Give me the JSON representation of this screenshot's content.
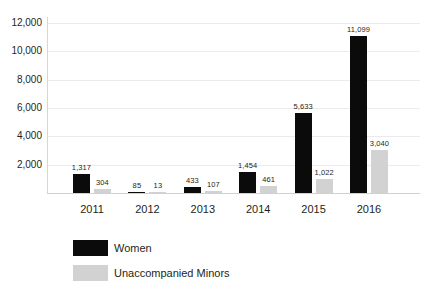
{
  "chart_data": {
    "type": "bar",
    "title": "",
    "xlabel": "",
    "ylabel": "",
    "categories": [
      "2011",
      "2012",
      "2013",
      "2014",
      "2015",
      "2016"
    ],
    "series": [
      {
        "name": "Women",
        "color": "#0b0b0b",
        "values": [
          1317,
          85,
          433,
          1454,
          5633,
          11099
        ],
        "labels": [
          "1,317",
          "85",
          "433",
          "1,454",
          "5,633",
          "11,099"
        ]
      },
      {
        "name": "Unaccompanied Minors",
        "color": "#d2d2d2",
        "values": [
          304,
          13,
          107,
          461,
          1022,
          3040
        ],
        "labels": [
          "304",
          "13",
          "107",
          "461",
          "1,022",
          "3,040"
        ]
      }
    ],
    "ylim": [
      0,
      12000
    ],
    "yticks": [
      2000,
      4000,
      6000,
      8000,
      10000,
      12000
    ],
    "ytick_labels": [
      "2,000",
      "4,000",
      "6,000",
      "8,000",
      "10,000",
      "12,000"
    ],
    "grid": true,
    "legend_position": "bottom-left"
  }
}
